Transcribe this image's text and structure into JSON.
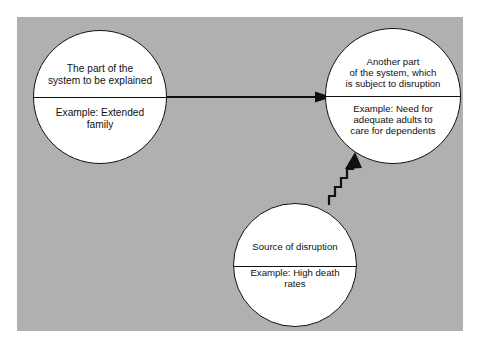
{
  "diagram": {
    "type": "systems-disruption-model",
    "background_color": "#b0b0b0",
    "stroke_color": "#111111",
    "node_fill": "#ffffff",
    "nodes": [
      {
        "id": "origin",
        "title": "The part of the\nsystem to be explained",
        "example": "Example: Extended\nfamily",
        "center": [
          100,
          97
        ],
        "radius": 67
      },
      {
        "id": "target",
        "title": "Another part\nof the system,  which\nis subject  to disruption",
        "example": "Example: Need for\nadequate adults to\ncare for dependents",
        "center": [
          393,
          96
        ],
        "radius": 68
      },
      {
        "id": "disruption",
        "title": "Source of disruption",
        "example": "Example: High death\nrates",
        "center": [
          295,
          265
        ],
        "radius": 62
      }
    ],
    "edges": [
      {
        "id": "origin-to-target",
        "from": "origin",
        "to": "target",
        "style": "straight-arrow",
        "label": ""
      },
      {
        "id": "disruption-to-target",
        "from": "disruption",
        "to": "target",
        "style": "zigzag-arrow",
        "label": ""
      }
    ]
  }
}
